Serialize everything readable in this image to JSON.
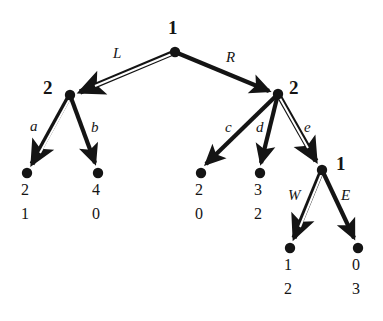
{
  "diagram": {
    "background_color": "#ffffff",
    "ink_color": "#141414",
    "nodes": [
      {
        "id": "root",
        "owner_label": "1",
        "x": 175,
        "y": 52,
        "label_x": 168,
        "label_y": 18
      },
      {
        "id": "n-l",
        "owner_label": "2",
        "x": 70,
        "y": 95,
        "label_x": 43,
        "label_y": 78
      },
      {
        "id": "n-r",
        "owner_label": "2",
        "x": 278,
        "y": 94,
        "label_x": 289,
        "label_y": 78
      },
      {
        "id": "n-rr",
        "owner_label": "1",
        "x": 322,
        "y": 170,
        "label_x": 336,
        "label_y": 154
      }
    ],
    "terminals": [
      {
        "id": "t-a",
        "x": 27,
        "y": 173,
        "top_value": "2",
        "bottom_value": "1",
        "value_x": 21,
        "top_y": 182,
        "bottom_y": 206
      },
      {
        "id": "t-b",
        "x": 98,
        "y": 173,
        "top_value": "4",
        "bottom_value": "0",
        "value_x": 92,
        "top_y": 182,
        "bottom_y": 206
      },
      {
        "id": "t-c",
        "x": 201,
        "y": 173,
        "top_value": "2",
        "bottom_value": "0",
        "value_x": 195,
        "top_y": 182,
        "bottom_y": 206
      },
      {
        "id": "t-d",
        "x": 260,
        "y": 173,
        "top_value": "3",
        "bottom_value": "2",
        "value_x": 254,
        "top_y": 182,
        "bottom_y": 206
      },
      {
        "id": "t-w",
        "x": 290,
        "y": 248,
        "top_value": "1",
        "bottom_value": "2",
        "value_x": 284,
        "top_y": 257,
        "bottom_y": 281
      },
      {
        "id": "t-e",
        "x": 358,
        "y": 248,
        "top_value": "0",
        "bottom_value": "3",
        "value_x": 352,
        "top_y": 257,
        "bottom_y": 281
      }
    ],
    "edges": [
      {
        "id": "edge-L",
        "label": "L",
        "from": "root",
        "to": "n-l",
        "style": "double",
        "label_x": 113,
        "label_y": 46
      },
      {
        "id": "edge-R",
        "label": "R",
        "from": "root",
        "to": "n-r",
        "style": "solid",
        "label_x": 226,
        "label_y": 50
      },
      {
        "id": "edge-a",
        "label": "a",
        "from": "n-l",
        "to": "t-a",
        "style": "double",
        "label_x": 30,
        "label_y": 119
      },
      {
        "id": "edge-b",
        "label": "b",
        "from": "n-l",
        "to": "t-b",
        "style": "solid",
        "label_x": 91,
        "label_y": 120
      },
      {
        "id": "edge-c",
        "label": "c",
        "from": "n-r",
        "to": "t-c",
        "style": "solid",
        "label_x": 225,
        "label_y": 120
      },
      {
        "id": "edge-d",
        "label": "d",
        "from": "n-r",
        "to": "t-d",
        "style": "solid",
        "label_x": 256,
        "label_y": 120
      },
      {
        "id": "edge-e",
        "label": "e",
        "from": "n-r",
        "to": "n-rr",
        "style": "double",
        "label_x": 304,
        "label_y": 120
      },
      {
        "id": "edge-W",
        "label": "W",
        "from": "n-rr",
        "to": "t-w",
        "style": "double",
        "label_x": 288,
        "label_y": 188
      },
      {
        "id": "edge-E",
        "label": "E",
        "from": "n-rr",
        "to": "t-e",
        "style": "solid",
        "label_x": 341,
        "label_y": 188
      }
    ]
  }
}
